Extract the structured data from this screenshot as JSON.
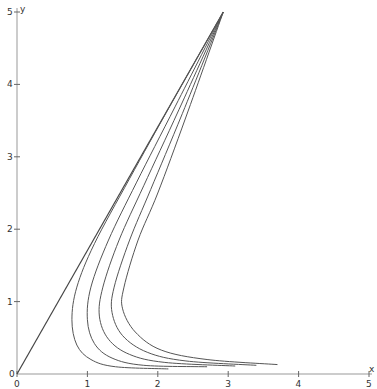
{
  "chart_data": {
    "type": "line",
    "title": "",
    "xlabel": "x",
    "ylabel": "y",
    "xlim": [
      0,
      5
    ],
    "ylim": [
      0,
      5
    ],
    "grid": false,
    "legend": null,
    "x_ticks": [
      "0",
      "1",
      "2",
      "3",
      "4",
      "5"
    ],
    "y_ticks": [
      "0",
      "1",
      "2",
      "3",
      "4",
      "5"
    ],
    "series": [
      {
        "name": "line",
        "points": [
          [
            0,
            0
          ],
          [
            2.93,
            5
          ]
        ]
      },
      {
        "name": "curve-1",
        "points": [
          [
            2.93,
            5
          ],
          [
            2.2,
            3.75
          ],
          [
            1.6,
            2.7
          ],
          [
            1.1,
            1.8
          ],
          [
            0.85,
            1.2
          ],
          [
            0.78,
            0.75
          ],
          [
            0.85,
            0.4
          ],
          [
            1.05,
            0.2
          ],
          [
            1.4,
            0.1
          ],
          [
            2.15,
            0.07
          ]
        ]
      },
      {
        "name": "curve-2",
        "points": [
          [
            2.93,
            5
          ],
          [
            2.25,
            3.7
          ],
          [
            1.7,
            2.65
          ],
          [
            1.3,
            1.85
          ],
          [
            1.05,
            1.2
          ],
          [
            1.0,
            0.75
          ],
          [
            1.1,
            0.42
          ],
          [
            1.35,
            0.22
          ],
          [
            1.8,
            0.12
          ],
          [
            2.7,
            0.1
          ]
        ]
      },
      {
        "name": "curve-3",
        "points": [
          [
            2.93,
            5
          ],
          [
            2.3,
            3.65
          ],
          [
            1.8,
            2.6
          ],
          [
            1.45,
            1.85
          ],
          [
            1.22,
            1.2
          ],
          [
            1.17,
            0.8
          ],
          [
            1.3,
            0.48
          ],
          [
            1.6,
            0.27
          ],
          [
            2.1,
            0.16
          ],
          [
            3.1,
            0.11
          ]
        ]
      },
      {
        "name": "curve-4",
        "points": [
          [
            2.93,
            5
          ],
          [
            2.35,
            3.6
          ],
          [
            1.9,
            2.55
          ],
          [
            1.6,
            1.85
          ],
          [
            1.38,
            1.2
          ],
          [
            1.35,
            0.85
          ],
          [
            1.5,
            0.53
          ],
          [
            1.85,
            0.3
          ],
          [
            2.4,
            0.18
          ],
          [
            3.4,
            0.12
          ]
        ]
      },
      {
        "name": "curve-5",
        "points": [
          [
            2.93,
            5
          ],
          [
            2.4,
            3.55
          ],
          [
            2.0,
            2.5
          ],
          [
            1.72,
            1.85
          ],
          [
            1.52,
            1.2
          ],
          [
            1.5,
            0.9
          ],
          [
            1.68,
            0.58
          ],
          [
            2.05,
            0.33
          ],
          [
            2.7,
            0.2
          ],
          [
            3.7,
            0.13
          ]
        ]
      }
    ]
  },
  "axes": {
    "x_label": "x",
    "y_label": "y",
    "origin_label": "0"
  },
  "colors": {
    "axis": "#999999",
    "curve": "#555555",
    "background": "#ffffff"
  }
}
